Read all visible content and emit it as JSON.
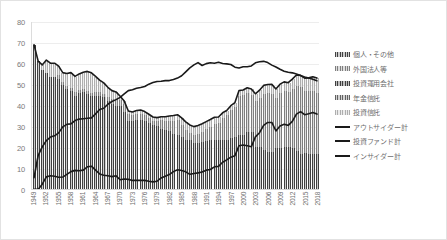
{
  "chart_data": {
    "type": "bar",
    "title": "",
    "subtitle": "",
    "xlabel": "",
    "ylabel": "",
    "ylim": [
      0,
      80
    ],
    "y_ticks": [
      0,
      10,
      20,
      30,
      40,
      50,
      60,
      70,
      80
    ],
    "grid": true,
    "legend_position": "right",
    "stacked": true,
    "x": [
      1949,
      1950,
      1951,
      1952,
      1953,
      1954,
      1955,
      1956,
      1957,
      1958,
      1959,
      1960,
      1961,
      1962,
      1963,
      1964,
      1965,
      1966,
      1967,
      1968,
      1969,
      1970,
      1971,
      1972,
      1973,
      1974,
      1975,
      1976,
      1977,
      1978,
      1979,
      1980,
      1981,
      1982,
      1983,
      1984,
      1985,
      1986,
      1987,
      1988,
      1989,
      1990,
      1991,
      1992,
      1993,
      1994,
      1995,
      1996,
      1997,
      1998,
      1999,
      2000,
      2001,
      2002,
      2003,
      2004,
      2005,
      2006,
      2007,
      2008,
      2009,
      2010,
      2011,
      2012,
      2013,
      2014,
      2015,
      2016,
      2017,
      2018
    ],
    "x_tick_labels": [
      "1949",
      "1952",
      "1955",
      "1958",
      "1961",
      "1964",
      "1967",
      "1970",
      "1973",
      "1976",
      "1979",
      "1982",
      "1985",
      "1988",
      "1991",
      "1994",
      "1997",
      "2000",
      "2003",
      "2006",
      "2009",
      "2012",
      "2015",
      "2018"
    ],
    "categories": [
      "1949",
      "1950",
      "1951",
      "1952",
      "1953",
      "1954",
      "1955",
      "1956",
      "1957",
      "1958",
      "1959",
      "1960",
      "1961",
      "1962",
      "1963",
      "1964",
      "1965",
      "1966",
      "1967",
      "1968",
      "1969",
      "1970",
      "1971",
      "1972",
      "1973",
      "1974",
      "1975",
      "1976",
      "1977",
      "1978",
      "1979",
      "1980",
      "1981",
      "1982",
      "1983",
      "1984",
      "1985",
      "1986",
      "1987",
      "1988",
      "1989",
      "1990",
      "1991",
      "1992",
      "1993",
      "1994",
      "1995",
      "1996",
      "1997",
      "1998",
      "1999",
      "2000",
      "2001",
      "2002",
      "2003",
      "2004",
      "2005",
      "2006",
      "2007",
      "2008",
      "2009",
      "2010",
      "2011",
      "2012",
      "2013",
      "2014",
      "2015",
      "2016",
      "2017",
      "2018"
    ],
    "series": [
      {
        "name": "個人・その他",
        "kind": "bar",
        "color": "#8f8f8f",
        "values": [
          69.1,
          61.3,
          57.0,
          55.8,
          53.8,
          54.0,
          53.1,
          49.9,
          48.2,
          47.3,
          44.9,
          46.3,
          46.7,
          45.6,
          44.6,
          44.8,
          44.8,
          44.1,
          42.3,
          41.1,
          40.1,
          39.9,
          37.2,
          32.7,
          32.7,
          33.4,
          33.5,
          32.9,
          32.0,
          31.0,
          30.4,
          29.2,
          28.4,
          28.0,
          26.8,
          26.3,
          25.2,
          23.9,
          23.6,
          22.4,
          22.6,
          23.1,
          23.2,
          23.9,
          23.7,
          23.6,
          23.6,
          23.6,
          24.6,
          25.4,
          26.4,
          26.3,
          27.7,
          27.6,
          20.6,
          20.3,
          19.1,
          18.1,
          18.2,
          20.1,
          20.0,
          20.3,
          20.4,
          20.2,
          18.7,
          17.3,
          17.5,
          17.1,
          17.0,
          17.2
        ]
      },
      {
        "name": "外国法人等",
        "kind": "bar",
        "color": "#b5b5b5",
        "values": [
          0.0,
          0.0,
          0.0,
          0.0,
          0.0,
          0.0,
          1.7,
          1.4,
          1.2,
          1.3,
          1.6,
          1.4,
          1.4,
          1.6,
          1.6,
          1.9,
          1.8,
          1.7,
          1.9,
          2.3,
          3.1,
          3.2,
          3.6,
          3.5,
          3.1,
          2.7,
          2.6,
          2.6,
          2.3,
          2.1,
          2.5,
          4.0,
          4.6,
          5.1,
          6.3,
          6.9,
          5.7,
          4.7,
          3.6,
          4.0,
          4.2,
          4.7,
          6.0,
          6.3,
          7.7,
          8.1,
          10.5,
          11.9,
          13.4,
          14.1,
          18.6,
          18.8,
          18.3,
          17.7,
          21.8,
          23.7,
          26.7,
          28.0,
          27.6,
          23.6,
          26.0,
          26.7,
          26.3,
          28.0,
          30.8,
          31.7,
          29.8,
          30.1,
          30.2,
          29.1
        ]
      },
      {
        "name": "投資運用会社",
        "kind": "bar",
        "color": "#7d7d7d",
        "values": [
          0.0,
          0.0,
          0.0,
          0.0,
          0.0,
          0.0,
          0.0,
          0.0,
          0.0,
          0.0,
          0.0,
          0.0,
          0.0,
          0.0,
          0.0,
          0.0,
          0.0,
          0.0,
          0.0,
          0.0,
          0.0,
          0.0,
          0.0,
          0.0,
          0.0,
          0.0,
          0.0,
          0.0,
          0.0,
          0.0,
          0.0,
          0.0,
          0.0,
          0.0,
          0.0,
          0.0,
          0.0,
          0.0,
          0.0,
          0.0,
          0.0,
          0.0,
          0.0,
          0.0,
          0.0,
          0.0,
          0.0,
          0.0,
          0.0,
          0.0,
          0.0,
          0.0,
          0.0,
          0.0,
          0.0,
          0.0,
          0.0,
          0.0,
          0.0,
          0.0,
          0.0,
          0.0,
          0.0,
          0.0,
          0.0,
          0.0,
          0.0,
          0.0,
          0.0,
          0.0
        ]
      },
      {
        "name": "年金信託",
        "kind": "bar",
        "color": "#9c9c9c",
        "values": [
          0.0,
          0.0,
          0.0,
          0.0,
          0.0,
          0.0,
          0.0,
          0.0,
          0.0,
          0.0,
          0.0,
          0.0,
          0.0,
          0.0,
          0.0,
          0.0,
          0.0,
          0.0,
          0.0,
          0.0,
          0.0,
          0.0,
          0.0,
          0.0,
          0.0,
          0.0,
          0.0,
          0.0,
          0.0,
          0.0,
          0.0,
          0.0,
          0.0,
          0.0,
          0.0,
          0.0,
          0.0,
          0.0,
          0.0,
          0.0,
          0.0,
          0.0,
          0.0,
          0.0,
          0.0,
          0.0,
          0.0,
          0.0,
          0.0,
          0.0,
          0.0,
          0.0,
          0.0,
          0.0,
          0.0,
          0.0,
          0.0,
          0.0,
          0.0,
          0.0,
          0.0,
          0.0,
          0.0,
          0.0,
          0.0,
          0.0,
          0.0,
          0.0,
          0.0,
          0.0
        ]
      },
      {
        "name": "投資信託",
        "kind": "bar",
        "color": "#cfcfcf",
        "values": [
          0.0,
          0.0,
          2.5,
          6.0,
          6.5,
          6.3,
          4.1,
          4.5,
          6.0,
          7.2,
          7.5,
          7.5,
          7.8,
          9.2,
          9.5,
          7.3,
          5.6,
          5.1,
          4.6,
          3.8,
          3.4,
          1.4,
          1.4,
          1.3,
          1.2,
          1.6,
          1.8,
          1.7,
          1.6,
          1.5,
          1.4,
          1.5,
          1.7,
          2.0,
          2.2,
          2.5,
          3.3,
          3.7,
          3.6,
          3.6,
          3.7,
          3.6,
          3.2,
          3.2,
          3.1,
          2.9,
          2.5,
          2.2,
          2.0,
          2.0,
          2.3,
          2.4,
          2.6,
          2.7,
          3.3,
          3.4,
          3.9,
          4.0,
          4.4,
          4.3,
          4.3,
          4.4,
          4.3,
          4.5,
          5.2,
          5.5,
          5.9,
          6.1,
          6.6,
          6.9
        ]
      },
      {
        "name": "アウトサイダー計",
        "kind": "line",
        "color": "#1a1a1a",
        "values": [
          69.1,
          61.3,
          59.5,
          61.8,
          60.3,
          60.3,
          58.9,
          55.8,
          55.4,
          55.8,
          54.0,
          55.2,
          56.0,
          56.4,
          55.7,
          54.0,
          52.2,
          50.9,
          48.8,
          47.2,
          46.6,
          44.5,
          42.2,
          37.5,
          37.0,
          37.7,
          37.9,
          37.2,
          35.9,
          34.6,
          34.3,
          34.7,
          34.7,
          35.1,
          35.3,
          35.7,
          34.2,
          32.3,
          30.8,
          30.0,
          30.5,
          31.4,
          32.4,
          33.4,
          34.5,
          34.6,
          36.6,
          37.7,
          40.0,
          41.5,
          47.3,
          47.5,
          48.6,
          48.0,
          45.7,
          47.4,
          49.7,
          50.1,
          50.2,
          48.0,
          50.3,
          51.4,
          51.0,
          52.7,
          54.7,
          54.5,
          53.2,
          53.3,
          53.8,
          53.2
        ]
      },
      {
        "name": "投資ファンド計",
        "kind": "line",
        "color": "#1a1a1a",
        "values": [
          0.0,
          0.0,
          2.5,
          6.0,
          6.5,
          6.3,
          5.8,
          5.9,
          7.2,
          8.5,
          9.1,
          8.9,
          9.2,
          10.8,
          11.1,
          9.2,
          7.4,
          6.8,
          6.5,
          6.1,
          6.5,
          4.6,
          5.0,
          4.8,
          4.3,
          4.3,
          4.4,
          4.3,
          3.9,
          3.6,
          3.9,
          5.5,
          6.3,
          7.1,
          8.5,
          9.4,
          9.0,
          8.4,
          7.2,
          7.6,
          7.9,
          8.3,
          9.2,
          9.5,
          10.8,
          11.0,
          13.0,
          14.1,
          15.4,
          16.1,
          20.9,
          21.2,
          20.9,
          20.4,
          25.1,
          27.1,
          30.6,
          32.0,
          32.0,
          27.9,
          30.3,
          31.1,
          30.6,
          32.5,
          36.0,
          37.2,
          35.7,
          36.2,
          36.8,
          36.0
        ]
      },
      {
        "name": "インサイダー計",
        "kind": "line",
        "color": "#1a1a1a",
        "values": [
          5.6,
          16.2,
          20.3,
          23.3,
          25.0,
          25.6,
          27.0,
          29.9,
          31.1,
          31.3,
          32.9,
          33.6,
          33.8,
          34.0,
          34.2,
          36.1,
          38.2,
          38.8,
          40.7,
          42.0,
          42.9,
          44.0,
          45.6,
          47.2,
          47.6,
          48.3,
          48.7,
          49.2,
          50.3,
          51.1,
          51.6,
          51.7,
          52.0,
          52.0,
          52.5,
          53.2,
          54.3,
          56.2,
          58.1,
          59.5,
          60.6,
          59.2,
          60.1,
          60.5,
          60.3,
          60.8,
          60.2,
          60.0,
          59.7,
          58.4,
          58.0,
          58.6,
          58.6,
          59.0,
          60.5,
          61.0,
          61.2,
          60.6,
          59.4,
          58.5,
          57.4,
          56.5,
          56.0,
          55.7,
          55.1,
          54.4,
          53.7,
          53.2,
          52.6,
          51.9
        ]
      }
    ]
  },
  "legend": {
    "items": [
      {
        "label": "個人・その他",
        "kind": "bar",
        "color": "#8f8f8f"
      },
      {
        "label": "外国法人等",
        "kind": "bar",
        "color": "#b5b5b5"
      },
      {
        "label": "投資運用会社",
        "kind": "bar",
        "color": "#7d7d7d"
      },
      {
        "label": "年金信託",
        "kind": "bar",
        "color": "#9c9c9c"
      },
      {
        "label": "投資信託",
        "kind": "bar",
        "color": "#cfcfcf"
      },
      {
        "label": "アウトサイダー計",
        "kind": "line",
        "color": "#1a1a1a"
      },
      {
        "label": "投資ファンド計",
        "kind": "line",
        "color": "#1a1a1a"
      },
      {
        "label": "インサイダー計",
        "kind": "line",
        "color": "#1a1a1a"
      }
    ]
  }
}
